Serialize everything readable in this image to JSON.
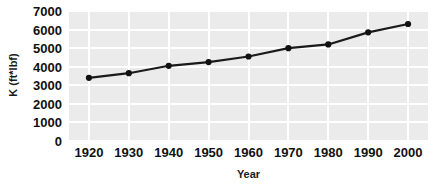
{
  "chart_data": {
    "type": "line",
    "title": "",
    "xlabel": "Year",
    "ylabel": "K (ft*lbf)",
    "x": [
      1920,
      1930,
      1940,
      1950,
      1960,
      1970,
      1980,
      1990,
      2000
    ],
    "values": [
      3400,
      3650,
      4050,
      4250,
      4550,
      5000,
      5200,
      5850,
      6300
    ],
    "series": [
      {
        "name": "K",
        "values": [
          3400,
          3650,
          4050,
          4250,
          4550,
          5000,
          5200,
          5850,
          6300
        ]
      }
    ],
    "xtick_labels": [
      "1920",
      "1930",
      "1940",
      "1950",
      "1960",
      "1970",
      "1980",
      "1990",
      "2000"
    ],
    "ytick_labels": [
      "0",
      "1000",
      "2000",
      "3000",
      "4000",
      "5000",
      "6000",
      "7000"
    ],
    "ytick_values": [
      0,
      1000,
      2000,
      3000,
      4000,
      5000,
      6000,
      7000
    ],
    "xlim": [
      1915,
      2005
    ],
    "ylim": [
      0,
      7000
    ],
    "grid": true,
    "legend": false,
    "marker": "circle",
    "colors": {
      "line": "#1a1a1a",
      "marker": "#111111",
      "plot_background": "#ebebeb",
      "gridline": "#ffffff",
      "figure_background": "#ffffff",
      "text": "#111111"
    }
  }
}
